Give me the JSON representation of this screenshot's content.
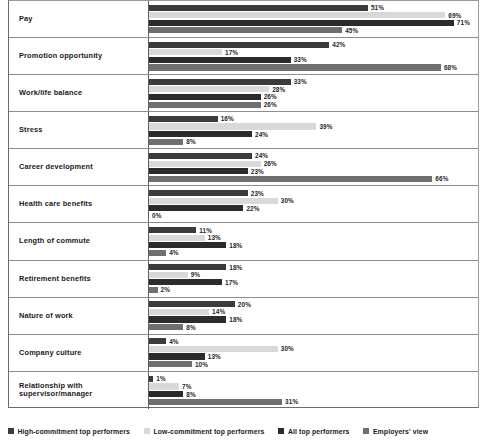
{
  "chart_data": {
    "type": "bar",
    "orientation": "horizontal",
    "title": "",
    "xlabel": "",
    "ylabel": "",
    "xlim": [
      0,
      75
    ],
    "grid": false,
    "legend_position": "bottom-left",
    "value_suffix": "%",
    "categories": [
      "Pay",
      "Promotion opportunity",
      "Work/life balance",
      "Stress",
      "Career development",
      "Health care benefits",
      "Length of commute",
      "Retirement benefits",
      "Nature of work",
      "Company culture",
      "Relationship with supervisor/manager"
    ],
    "series": [
      {
        "name": "High-commitment top performers",
        "color": "#3b3b3b",
        "values": [
          51,
          42,
          33,
          16,
          24,
          23,
          11,
          18,
          20,
          4,
          1
        ],
        "labels": [
          "51%",
          "42%",
          "33%",
          "16%",
          "24%",
          "23%",
          "11%",
          "18%",
          "20%",
          "4%",
          "1%"
        ]
      },
      {
        "name": "Low-commitment top performers",
        "color": "#d9d9d9",
        "values": [
          69,
          17,
          28,
          39,
          26,
          30,
          13,
          9,
          14,
          30,
          7
        ],
        "labels": [
          "69%",
          "17%",
          "28%",
          "39%",
          "26%",
          "30%",
          "13%",
          "9%",
          "14%",
          "30%",
          "7%"
        ]
      },
      {
        "name": "All top performers",
        "color": "#2b2b2b",
        "values": [
          71,
          33,
          26,
          24,
          23,
          22,
          18,
          17,
          18,
          13,
          8
        ],
        "labels": [
          "71%",
          "33%",
          "26%",
          "24%",
          "23%",
          "22%",
          "18%",
          "17%",
          "18%",
          "13%",
          "8%"
        ]
      },
      {
        "name": "Employers' view",
        "color": "#6f6f6f",
        "values": [
          45,
          68,
          26,
          8,
          66,
          0,
          4,
          2,
          8,
          10,
          31
        ],
        "labels": [
          "45%",
          "68%",
          "26%",
          "8%",
          "66%",
          "0%",
          "4%",
          "2%",
          "8%",
          "10%",
          "31%"
        ]
      }
    ]
  }
}
